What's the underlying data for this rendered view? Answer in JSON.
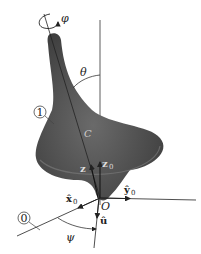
{
  "diagram": {
    "labels": {
      "spin_angle": "φ",
      "nutation_angle": "θ",
      "precession_angle": "ψ",
      "body_frame": "1",
      "fixed_frame": "0",
      "center_of_mass": "C",
      "origin": "O",
      "z_axis": "z",
      "z0_axis": "z",
      "z0_sub": "0",
      "x0_axis": "x̂",
      "x0_sub": "0",
      "y0_axis": "ŷ",
      "y0_sub": "0",
      "u_axis": "û"
    },
    "colors": {
      "body_fill": "#4a4a4a",
      "body_highlight": "#6e6e6e",
      "lines": "#222222",
      "background": "#ffffff"
    }
  }
}
